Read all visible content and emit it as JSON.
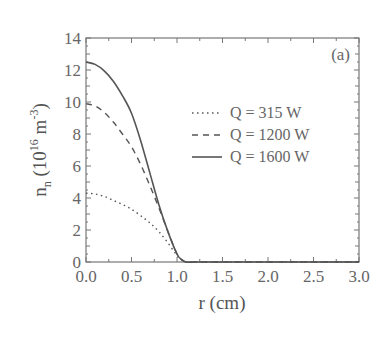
{
  "chart_data": {
    "type": "line",
    "title": "",
    "panel_label": "(a)",
    "xlabel": "r (cm)",
    "ylabel": "n_n (10^16 m^-3)",
    "xlim": [
      0.0,
      3.0
    ],
    "ylim": [
      0,
      14
    ],
    "xticks": [
      "0.0",
      "0.5",
      "1.0",
      "1.5",
      "2.0",
      "2.5",
      "3.0"
    ],
    "yticks": [
      "0",
      "2",
      "4",
      "6",
      "8",
      "10",
      "12",
      "14"
    ],
    "grid": false,
    "legend_position": "upper right (inside)",
    "x": [
      0.0,
      0.1,
      0.2,
      0.3,
      0.4,
      0.5,
      0.6,
      0.7,
      0.8,
      0.9,
      1.0,
      1.05,
      1.1,
      1.2,
      1.5,
      2.0,
      2.5,
      3.0
    ],
    "series": [
      {
        "name": "Q = 315 W",
        "style": "dotted",
        "values": [
          4.3,
          4.25,
          4.1,
          3.85,
          3.6,
          3.3,
          2.9,
          2.45,
          1.9,
          1.2,
          0.4,
          0.15,
          0.0,
          0.0,
          0.0,
          0.0,
          0.0,
          0.0
        ]
      },
      {
        "name": "Q = 1200 W",
        "style": "dashed",
        "values": [
          9.9,
          9.75,
          9.35,
          8.75,
          8.0,
          7.2,
          6.1,
          4.8,
          3.4,
          1.9,
          0.5,
          0.15,
          0.0,
          0.0,
          0.0,
          0.0,
          0.0,
          0.0
        ]
      },
      {
        "name": "Q = 1600 W",
        "style": "solid",
        "values": [
          12.5,
          12.35,
          11.95,
          11.3,
          10.4,
          9.3,
          7.6,
          5.6,
          3.6,
          1.9,
          0.5,
          0.15,
          0.0,
          0.0,
          0.0,
          0.0,
          0.0,
          0.0
        ]
      }
    ]
  },
  "labels": {
    "panel": "(a)",
    "xlabel": "r (cm)",
    "ylabel_main": "n",
    "ylabel_sub": "n",
    "ylabel_unit_open": " (10",
    "ylabel_exp1": "16",
    "ylabel_unit_mid": " m",
    "ylabel_exp2": "-3",
    "ylabel_unit_close": ")"
  },
  "legend": [
    {
      "label": "Q =  315 W",
      "style": "dotted"
    },
    {
      "label": "Q = 1200 W",
      "style": "dashed"
    },
    {
      "label": "Q = 1600 W",
      "style": "solid"
    }
  ],
  "colors": {
    "axis": "#777777",
    "line": "#555555",
    "text": "#666666"
  }
}
